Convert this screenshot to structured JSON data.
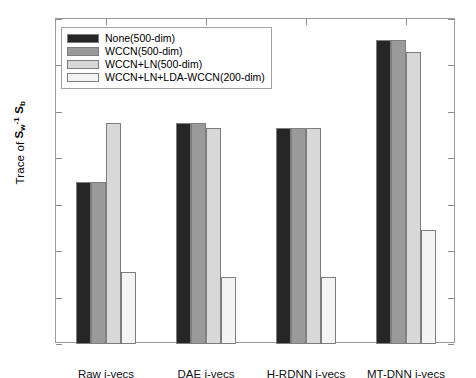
{
  "chart_data": {
    "type": "bar",
    "title": "",
    "xlabel": "",
    "ylabel": "Trace of S_w^-1 S_b",
    "ylabel_parts": {
      "prefix": "Trace of ",
      "s1": "S",
      "s1_sub": "w",
      "s1_sup": "-1",
      "space": " ",
      "s2": "S",
      "s2_sub": "b"
    },
    "ylim": [
      320,
      460
    ],
    "ytick_values": [
      320,
      340,
      360,
      380,
      400,
      420,
      440,
      460
    ],
    "ytick_labels": [
      "320",
      "340",
      "360",
      "380",
      "400",
      "420",
      "440",
      "460"
    ],
    "grid": false,
    "legend_position": "upper left",
    "categories": [
      "Raw i-vecs",
      "DAE i-vecs",
      "H-RDNN i-vecs",
      "MT-DNN i-vecs"
    ],
    "series": [
      {
        "name": "None(500-dim)",
        "color": "#262626",
        "values": [
          390,
          415,
          413,
          451
        ]
      },
      {
        "name": "WCCN(500-dim)",
        "color": "#9a9a9a",
        "values": [
          390,
          415,
          413,
          451
        ]
      },
      {
        "name": "WCCN+LN(500-dim)",
        "color": "#d8d8d8",
        "values": [
          415,
          413,
          413,
          446
        ]
      },
      {
        "name": "WCCN+LN+LDA-WCCN(200-dim)",
        "color": "#f4f4f4",
        "values": [
          351,
          349,
          349,
          369
        ]
      }
    ]
  },
  "legend": {
    "items": [
      {
        "label": "None(500-dim)",
        "color": "#262626"
      },
      {
        "label": "WCCN(500-dim)",
        "color": "#9a9a9a"
      },
      {
        "label": "WCCN+LN(500-dim)",
        "color": "#d8d8d8"
      },
      {
        "label": "WCCN+LN+LDA-WCCN(200-dim)",
        "color": "#f4f4f4"
      }
    ]
  }
}
